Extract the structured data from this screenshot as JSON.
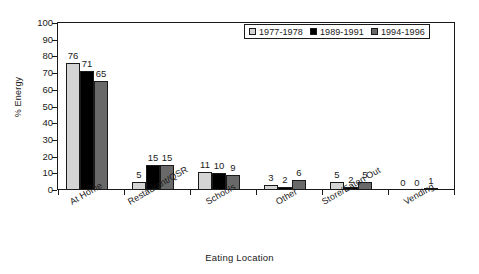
{
  "chart_data": {
    "type": "bar",
    "title": "",
    "xlabel": "Eating Location",
    "ylabel": "% Energy",
    "ylim": [
      0,
      100
    ],
    "yticks": [
      0,
      10,
      20,
      30,
      40,
      50,
      60,
      70,
      80,
      90,
      100
    ],
    "grid": false,
    "legend_position": "top-right",
    "categories": [
      "At Home",
      "Restaurant/QSR",
      "Schools",
      "Other",
      "Store/Eaten Out",
      "Vending"
    ],
    "series": [
      {
        "name": "1977-1978",
        "color": "#d4d4d4",
        "values": [
          76,
          5,
          11,
          3,
          5,
          0
        ]
      },
      {
        "name": "1989-1991",
        "color": "#000000",
        "values": [
          71,
          15,
          10,
          2,
          2,
          0
        ]
      },
      {
        "name": "1994-1996",
        "color": "#696969",
        "values": [
          65,
          15,
          9,
          6,
          5,
          1
        ]
      }
    ]
  },
  "axis": {
    "y_title": "% Energy",
    "x_title": "Eating Location",
    "y_tick_labels": [
      "100",
      "90",
      "80",
      "70",
      "60",
      "50",
      "40",
      "30",
      "20",
      "10",
      "0"
    ]
  },
  "legend": {
    "entries": [
      {
        "label": "1977-1978"
      },
      {
        "label": "1989-1991"
      },
      {
        "label": "1994-1996"
      }
    ]
  }
}
